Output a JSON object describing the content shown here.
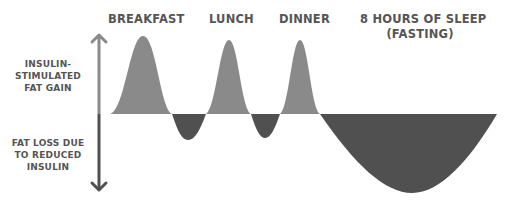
{
  "diagram": {
    "meal_labels": [
      {
        "label": "BREAKFAST"
      },
      {
        "label": "LUNCH"
      },
      {
        "label": "DINNER"
      },
      {
        "label": "8 HOURS OF SLEEP",
        "sublabel": "(FASTING)"
      }
    ],
    "axis": {
      "up_label": [
        "INSULIN-",
        "STIMULATED",
        "FAT GAIN"
      ],
      "down_label": [
        "FAT LOSS DUE",
        "TO REDUCED",
        "INSULIN"
      ]
    },
    "colors": {
      "gain": "#8a8a8a",
      "loss": "#505050",
      "text": "#555555",
      "arrow_up": "#8a8a8a",
      "arrow_down": "#505050"
    }
  }
}
